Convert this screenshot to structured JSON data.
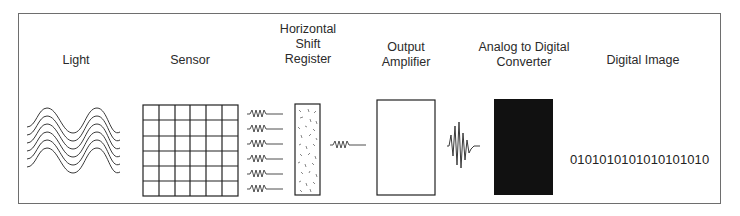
{
  "diagram": {
    "title": "",
    "stages": [
      {
        "id": "light",
        "label_lines": [
          "Light"
        ],
        "icon": "light-waves-icon"
      },
      {
        "id": "sensor",
        "label_lines": [
          "Sensor"
        ],
        "icon": "sensor-grid-icon"
      },
      {
        "id": "hsr",
        "label_lines": [
          "Horizontal",
          "Shift",
          "Register"
        ],
        "icon": "shift-register-icon"
      },
      {
        "id": "amp",
        "label_lines": [
          "Output",
          "Amplifier"
        ],
        "icon": "amplifier-box-icon"
      },
      {
        "id": "adc",
        "label_lines": [
          "Analog to Digital",
          "Converter"
        ],
        "icon": "adc-black-box-icon"
      },
      {
        "id": "digital",
        "label_lines": [
          "Digital Image"
        ],
        "icon": "binary-digits-icon"
      }
    ],
    "binary_output": "0101010101010101010",
    "sensor_grid": {
      "rows": 6,
      "cols": 6
    },
    "light_wave_count": 6,
    "register_input_signals": 6,
    "colors": {
      "line": "#3a3a3a",
      "frame": "#6e6e6e",
      "adc_fill": "#111111"
    }
  }
}
